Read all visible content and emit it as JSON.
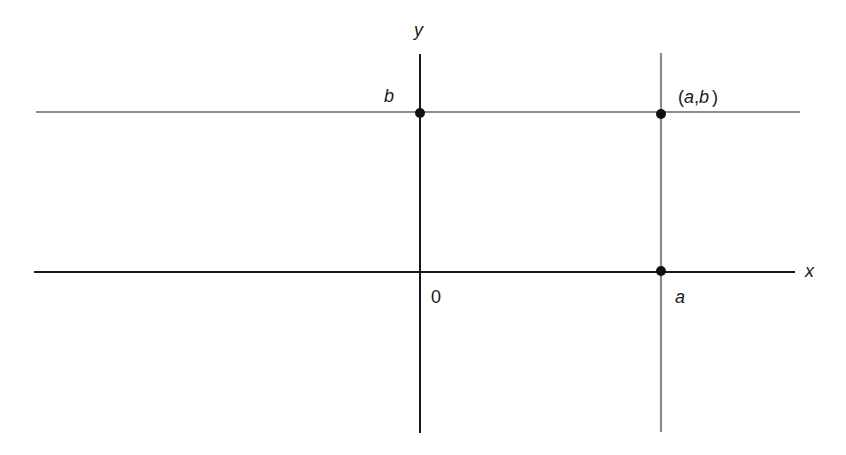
{
  "diagram": {
    "title": "",
    "labels": {
      "y_axis": "y",
      "x_axis": "x",
      "origin": "0",
      "b": "b",
      "a": "a",
      "point_open": "(",
      "point_a": "a",
      "point_comma": ",",
      "point_b": "b",
      "point_close": ")"
    },
    "colors": {
      "axis": "#1a1a1a",
      "guide_line": "#8c8c8c",
      "point": "#111111"
    },
    "points": [
      {
        "name": "b-on-y-axis",
        "x": 0,
        "y": "b"
      },
      {
        "name": "point-a-b",
        "x": "a",
        "y": "b"
      },
      {
        "name": "a-on-x-axis",
        "x": "a",
        "y": 0
      }
    ]
  }
}
